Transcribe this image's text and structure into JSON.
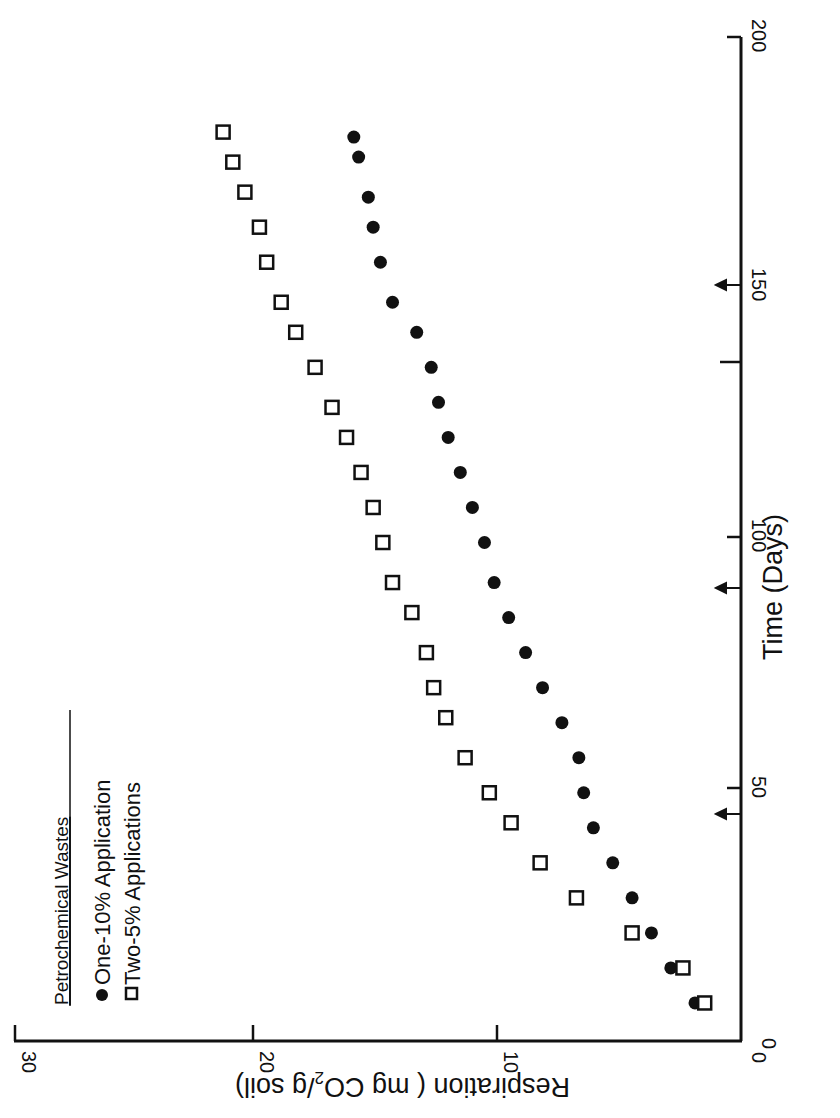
{
  "chart_data": {
    "type": "scatter",
    "orientation": "rotated 90 degrees clockwise (x-axis runs vertically along right edge)",
    "title": "Petrochemical Wastes",
    "xlabel": "Time (Days)",
    "ylabel": "Respiration (mg CO2/g soil)",
    "xlim": [
      0,
      200
    ],
    "ylim": [
      0,
      30
    ],
    "x_ticks": [
      0,
      50,
      100,
      150,
      200
    ],
    "y_ticks": [
      0,
      10,
      20,
      30
    ],
    "grid": false,
    "legend_position": "upper left (in rotated view)",
    "annotations": [
      {
        "type": "arrow",
        "x": 45,
        "label": "application arrow"
      },
      {
        "type": "arrow",
        "x": 90,
        "label": "application arrow"
      },
      {
        "type": "arrow",
        "x": 150,
        "label": "application arrow"
      }
    ],
    "series": [
      {
        "name": "One-10% Application",
        "marker": "filled-circle",
        "x": [
          7,
          14,
          21,
          28,
          35,
          42,
          49,
          56,
          63,
          70,
          77,
          84,
          91,
          99,
          106,
          113,
          120,
          127,
          134,
          141,
          147,
          155,
          162,
          168,
          176,
          180
        ],
        "values": [
          1.9,
          2.9,
          3.7,
          4.5,
          5.3,
          6.1,
          6.5,
          6.7,
          7.4,
          8.2,
          8.9,
          9.6,
          10.2,
          10.6,
          11.1,
          11.6,
          12.1,
          12.5,
          12.8,
          13.4,
          14.4,
          14.9,
          15.2,
          15.4,
          15.8,
          16.0
        ]
      },
      {
        "name": "Two-5% Applications",
        "marker": "open-square",
        "x": [
          7,
          14,
          21,
          28,
          35,
          43,
          49,
          56,
          64,
          70,
          77,
          85,
          91,
          99,
          106,
          113,
          120,
          126,
          134,
          141,
          147,
          155,
          162,
          169,
          175,
          181
        ],
        "values": [
          1.5,
          2.4,
          4.5,
          6.8,
          8.3,
          9.5,
          10.4,
          11.4,
          12.2,
          12.7,
          13.0,
          13.6,
          14.4,
          14.8,
          15.2,
          15.7,
          16.3,
          16.9,
          17.6,
          18.4,
          19.0,
          19.6,
          19.9,
          20.5,
          21.0,
          21.4
        ]
      }
    ]
  },
  "labels": {
    "title": "Petrochemical Wastes",
    "legend_one": "One-10% Application",
    "legend_two": "Two-5% Applications",
    "xlabel": "Time (Days)",
    "ylabel_pre": "Respiration ( mg CO",
    "ylabel_sub": "2",
    "ylabel_post": "/g soil)",
    "x_tick_0": "0",
    "x_tick_50": "50",
    "x_tick_100": "100",
    "x_tick_150": "150",
    "x_tick_200": "200",
    "y_tick_0": "0",
    "y_tick_10": "10",
    "y_tick_20": "20",
    "y_tick_30": "30"
  }
}
